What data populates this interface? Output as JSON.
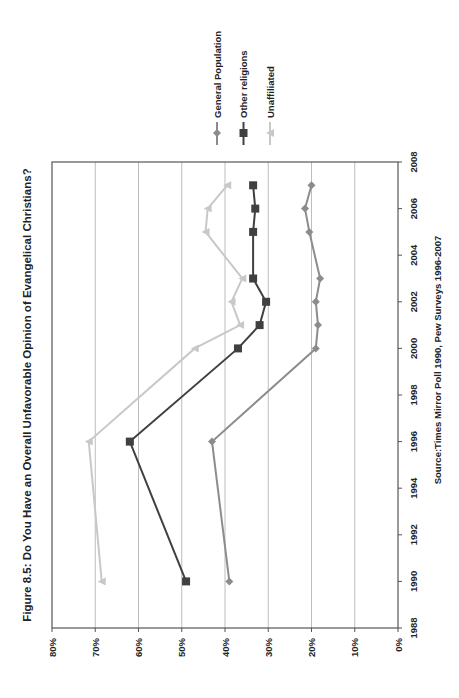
{
  "chart_data": {
    "type": "line",
    "title": "Figure 8.5: Do You Have an Overall Unfavorable Opinion of Evangelical Christians?",
    "source": "Source:Times Mirror Poll 1990, Pew Surveys 1996-2007",
    "xlabel": "",
    "ylabel": "",
    "orientation": "rotated 90° counter-clockwise on page",
    "x_ticks": [
      "1988",
      "1990",
      "1992",
      "1994",
      "1996",
      "1998",
      "2000",
      "2002",
      "2004",
      "2006",
      "2008"
    ],
    "xlim": [
      1988,
      2008
    ],
    "y_ticks": [
      "0%",
      "10%",
      "20%",
      "30%",
      "40%",
      "50%",
      "60%",
      "70%",
      "80%"
    ],
    "ylim": [
      0,
      80
    ],
    "grid": true,
    "legend_position": "right",
    "series": [
      {
        "name": "General Population",
        "color": "#8c8c8c",
        "marker": "diamond",
        "x": [
          1990,
          1996,
          2000,
          2001,
          2002,
          2003,
          2005,
          2006,
          2007
        ],
        "values": [
          39,
          43,
          19,
          18.5,
          19,
          18,
          20.5,
          21.5,
          20
        ]
      },
      {
        "name": "Other religions",
        "color": "#404040",
        "marker": "square",
        "x": [
          1990,
          1996,
          2000,
          2001,
          2002,
          2003,
          2005,
          2006,
          2007
        ],
        "values": [
          49,
          62,
          37,
          32,
          30.5,
          33.5,
          33.5,
          33,
          33.5
        ]
      },
      {
        "name": "Unaffiliated",
        "color": "#c8c8c8",
        "marker": "triangle",
        "x": [
          1990,
          1996,
          2000,
          2001,
          2002,
          2003,
          2005,
          2006,
          2007
        ],
        "values": [
          68.5,
          71.5,
          47,
          36.5,
          38.5,
          36,
          44.5,
          44,
          39.5
        ]
      }
    ]
  }
}
